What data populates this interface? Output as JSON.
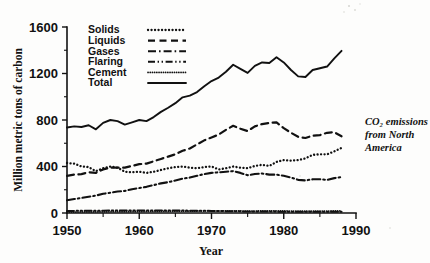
{
  "figure": {
    "annotation_line1": "CO₂ emissions",
    "annotation_line2": "from North",
    "annotation_line3": "America"
  },
  "chart_data": {
    "type": "line",
    "title": "",
    "xlabel": "Year",
    "ylabel": "Million metric tons of carbon",
    "xlim": [
      1950,
      1990
    ],
    "ylim": [
      0,
      1600
    ],
    "xticks": [
      1950,
      1960,
      1970,
      1980,
      1990
    ],
    "xtick_labels": [
      "1950",
      "1960",
      "1970",
      "1980",
      "1990"
    ],
    "xticks_minor": [
      1955,
      1965,
      1975,
      1985
    ],
    "yticks": [
      0,
      400,
      800,
      1200,
      1600
    ],
    "ytick_labels": [
      "0",
      "400",
      "800",
      "1200",
      "1600"
    ],
    "yticks_minor": [
      200,
      600,
      1000,
      1400
    ],
    "grid": false,
    "legend_position": "top-left-inside",
    "x": [
      1950,
      1951,
      1952,
      1953,
      1954,
      1955,
      1956,
      1957,
      1958,
      1959,
      1960,
      1961,
      1962,
      1963,
      1964,
      1965,
      1966,
      1967,
      1968,
      1969,
      1970,
      1971,
      1972,
      1973,
      1974,
      1975,
      1976,
      1977,
      1978,
      1979,
      1980,
      1981,
      1982,
      1983,
      1984,
      1985,
      1986,
      1987,
      1988
    ],
    "series": [
      {
        "name": "Solids",
        "style": "dotted",
        "values": [
          430,
          425,
          400,
          395,
          360,
          385,
          400,
          390,
          355,
          350,
          355,
          345,
          355,
          370,
          385,
          395,
          400,
          390,
          385,
          395,
          400,
          375,
          385,
          400,
          390,
          385,
          405,
          415,
          405,
          440,
          455,
          450,
          455,
          470,
          500,
          505,
          505,
          530,
          560
        ]
      },
      {
        "name": "Liquids",
        "style": "dashed",
        "values": [
          320,
          330,
          335,
          350,
          345,
          375,
          390,
          390,
          390,
          405,
          420,
          425,
          445,
          465,
          485,
          505,
          535,
          555,
          590,
          625,
          650,
          675,
          715,
          750,
          725,
          705,
          745,
          765,
          775,
          780,
          730,
          690,
          655,
          645,
          665,
          670,
          690,
          695,
          660
        ]
      },
      {
        "name": "Gases",
        "style": "dash-dot",
        "values": [
          110,
          120,
          130,
          140,
          150,
          165,
          175,
          185,
          190,
          205,
          215,
          225,
          240,
          255,
          265,
          280,
          295,
          305,
          320,
          335,
          345,
          350,
          355,
          360,
          345,
          325,
          335,
          340,
          330,
          330,
          320,
          305,
          285,
          280,
          290,
          290,
          285,
          300,
          310
        ]
      },
      {
        "name": "Flaring",
        "style": "dash-dot-dot",
        "values": [
          18,
          18,
          19,
          19,
          20,
          20,
          21,
          21,
          21,
          22,
          22,
          22,
          22,
          22,
          22,
          21,
          21,
          20,
          20,
          19,
          18,
          17,
          16,
          15,
          14,
          13,
          13,
          12,
          12,
          12,
          11,
          11,
          10,
          10,
          10,
          10,
          10,
          10,
          10
        ]
      },
      {
        "name": "Cement",
        "style": "fine-dotted",
        "values": [
          8,
          8,
          9,
          9,
          10,
          10,
          11,
          11,
          11,
          12,
          12,
          13,
          13,
          14,
          14,
          15,
          15,
          16,
          16,
          17,
          17,
          17,
          18,
          18,
          18,
          16,
          17,
          18,
          18,
          19,
          18,
          17,
          16,
          16,
          17,
          17,
          17,
          18,
          18
        ]
      },
      {
        "name": "Total",
        "style": "solid",
        "values": [
          735,
          745,
          740,
          755,
          720,
          775,
          800,
          790,
          760,
          780,
          800,
          790,
          825,
          870,
          905,
          945,
          995,
          1010,
          1040,
          1090,
          1135,
          1165,
          1215,
          1275,
          1240,
          1205,
          1265,
          1295,
          1290,
          1340,
          1295,
          1230,
          1175,
          1170,
          1230,
          1245,
          1260,
          1330,
          1395
        ]
      }
    ]
  },
  "legend": {
    "items": [
      {
        "label": "Solids",
        "style": "dotted"
      },
      {
        "label": "Liquids",
        "style": "dashed"
      },
      {
        "label": "Gases",
        "style": "dash-dot"
      },
      {
        "label": "Flaring",
        "style": "dash-dot-dot"
      },
      {
        "label": "Cement",
        "style": "fine-dotted"
      },
      {
        "label": "Total",
        "style": "solid"
      }
    ]
  }
}
